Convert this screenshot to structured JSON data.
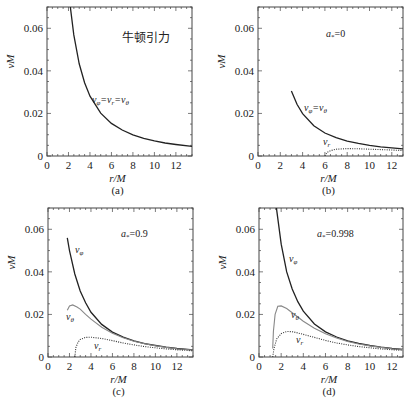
{
  "figure": {
    "ylabel": "νM",
    "xlabel": "r/M"
  },
  "chart_data": [
    {
      "type": "line",
      "panel": "(a)",
      "annotation": "牛顿引力",
      "xlabel": "r/M",
      "ylabel": "νM",
      "xlim": [
        0,
        13.5
      ],
      "ylim": [
        0,
        0.07
      ],
      "xticks": [
        0,
        2,
        4,
        6,
        8,
        10,
        12
      ],
      "yticks": [
        "0",
        "0.02",
        "0.04",
        "0.06"
      ],
      "grid": false,
      "series": [
        {
          "name": "ν_φ=ν_r=ν_θ",
          "style": "solid",
          "x": [
            2.0,
            2.2,
            2.5,
            3,
            3.5,
            4,
            5,
            6,
            7,
            8,
            9,
            10,
            11,
            12,
            13.5
          ],
          "y": [
            0.0796,
            0.069,
            0.0569,
            0.0433,
            0.0344,
            0.0281,
            0.0201,
            0.0153,
            0.0122,
            0.0099,
            0.0083,
            0.0071,
            0.0061,
            0.0054,
            0.0045
          ]
        }
      ]
    },
    {
      "type": "line",
      "panel": "(b)",
      "annotation": "a*=0",
      "xlabel": "r/M",
      "ylabel": "νM",
      "xlim": [
        0,
        13
      ],
      "ylim": [
        0,
        0.07
      ],
      "xticks": [
        0,
        2,
        4,
        6,
        8,
        10,
        12
      ],
      "yticks": [
        "0",
        "0.02",
        "0.04",
        "0.06"
      ],
      "grid": false,
      "series": [
        {
          "name": "ν_φ=ν_θ",
          "style": "solid",
          "x": [
            3,
            3.5,
            4,
            5,
            6,
            7,
            8,
            9,
            10,
            11,
            12,
            13
          ],
          "y": [
            0.0306,
            0.0243,
            0.0199,
            0.0142,
            0.0108,
            0.0086,
            0.007,
            0.0059,
            0.005,
            0.0043,
            0.0038,
            0.0034
          ]
        },
        {
          "name": "ν_r",
          "style": "dotted",
          "x": [
            6,
            6.2,
            6.5,
            7,
            8,
            9,
            10,
            11,
            12,
            13
          ],
          "y": [
            0.0,
            0.0017,
            0.0025,
            0.0032,
            0.0035,
            0.0034,
            0.0032,
            0.003,
            0.0028,
            0.0026
          ]
        }
      ]
    },
    {
      "type": "line",
      "panel": "(c)",
      "annotation": "a*=0.9",
      "xlabel": "r/M",
      "ylabel": "νM",
      "xlim": [
        0,
        13.5
      ],
      "ylim": [
        0,
        0.07
      ],
      "xticks": [
        0,
        2,
        4,
        6,
        8,
        10,
        12
      ],
      "yticks": [
        "0",
        "0.02",
        "0.04",
        "0.06"
      ],
      "grid": false,
      "series": [
        {
          "name": "ν_φ",
          "style": "solid",
          "x": [
            1.8,
            2,
            2.5,
            3,
            3.5,
            4,
            5,
            6,
            7,
            8,
            9,
            10,
            11,
            12,
            13.5
          ],
          "y": [
            0.056,
            0.05,
            0.039,
            0.031,
            0.0255,
            0.021,
            0.0153,
            0.0117,
            0.0093,
            0.0076,
            0.0063,
            0.0054,
            0.0046,
            0.004,
            0.0034
          ]
        },
        {
          "name": "ν_θ",
          "style": "solid-gray",
          "x": [
            1.8,
            2,
            2.3,
            2.7,
            3,
            3.5,
            4,
            5,
            6,
            7,
            8,
            9,
            10,
            11,
            12,
            13.5
          ],
          "y": [
            0.022,
            0.024,
            0.0245,
            0.0235,
            0.0225,
            0.02,
            0.0178,
            0.014,
            0.0112,
            0.009,
            0.0074,
            0.0062,
            0.0053,
            0.0045,
            0.0039,
            0.0033
          ]
        },
        {
          "name": "ν_r",
          "style": "dotted",
          "x": [
            2.5,
            2.6,
            2.8,
            3,
            3.5,
            4,
            5,
            6,
            7,
            8,
            9,
            10,
            11,
            12,
            13.5
          ],
          "y": [
            0.0,
            0.0045,
            0.007,
            0.0082,
            0.0092,
            0.0093,
            0.0087,
            0.0077,
            0.0066,
            0.0057,
            0.0049,
            0.0043,
            0.0038,
            0.0034,
            0.0029
          ]
        }
      ]
    },
    {
      "type": "line",
      "panel": "(d)",
      "annotation": "a*=0.998",
      "xlabel": "r/M",
      "ylabel": "νM",
      "xlim": [
        0,
        13
      ],
      "ylim": [
        0,
        0.07
      ],
      "xticks": [
        0,
        2,
        4,
        6,
        8,
        10,
        12
      ],
      "yticks": [
        "0",
        "0.02",
        "0.04",
        "0.06"
      ],
      "grid": false,
      "series": [
        {
          "name": "ν_φ",
          "style": "solid",
          "x": [
            1.24,
            1.4,
            1.6,
            2,
            2.5,
            3,
            3.5,
            4,
            5,
            6,
            7,
            8,
            9,
            10,
            11,
            12,
            13
          ],
          "y": [
            0.092,
            0.08,
            0.069,
            0.053,
            0.04,
            0.032,
            0.026,
            0.0215,
            0.0155,
            0.0118,
            0.0094,
            0.0076,
            0.0064,
            0.0054,
            0.0046,
            0.004,
            0.0036
          ]
        },
        {
          "name": "ν_θ",
          "style": "solid-gray",
          "x": [
            1.24,
            1.3,
            1.45,
            1.7,
            2,
            2.5,
            3,
            3.5,
            4,
            5,
            6,
            7,
            8,
            9,
            10,
            11,
            12,
            13
          ],
          "y": [
            0.004,
            0.012,
            0.02,
            0.0238,
            0.024,
            0.0228,
            0.0208,
            0.0188,
            0.0168,
            0.0135,
            0.0109,
            0.0089,
            0.0073,
            0.0061,
            0.0052,
            0.0045,
            0.0039,
            0.0035
          ]
        },
        {
          "name": "ν_r",
          "style": "dotted",
          "x": [
            1.24,
            1.35,
            1.6,
            2,
            2.5,
            3,
            3.5,
            4,
            5,
            6,
            7,
            8,
            9,
            10,
            11,
            12,
            13
          ],
          "y": [
            0.0,
            0.004,
            0.0085,
            0.011,
            0.012,
            0.0119,
            0.0113,
            0.0106,
            0.0092,
            0.0078,
            0.0066,
            0.0057,
            0.0049,
            0.0043,
            0.0038,
            0.0034,
            0.0031
          ]
        }
      ]
    }
  ],
  "panels": [
    {
      "caption": "(a)",
      "box": {
        "x": 47,
        "y": 7,
        "w": 145,
        "h": 149
      },
      "x0px": 47,
      "xscale": 10.74,
      "annotation_pos": {
        "x": 122,
        "y": 42
      },
      "labels": [
        {
          "text": "ν_φ=ν_r=ν_θ",
          "x": 92,
          "y": 103,
          "series": 0
        }
      ],
      "cn": true
    },
    {
      "caption": "(b)",
      "box": {
        "x": 258,
        "y": 7,
        "w": 145,
        "h": 149
      },
      "x0px": 258,
      "xscale": 11.15,
      "annotation_pos": {
        "x": 326,
        "y": 37
      },
      "labels": [
        {
          "text": "ν_φ=ν_θ",
          "x": 304,
          "y": 111,
          "series": 0
        },
        {
          "text": "ν_r",
          "x": 323,
          "y": 145,
          "series": 1
        }
      ]
    },
    {
      "caption": "(c)",
      "box": {
        "x": 48,
        "y": 208,
        "w": 145,
        "h": 149
      },
      "x0px": 48,
      "xscale": 10.74,
      "annotation_pos": {
        "x": 121,
        "y": 237
      },
      "labels": [
        {
          "text": "ν_φ",
          "x": 75,
          "y": 253,
          "series": 0
        },
        {
          "text": "ν_θ",
          "x": 66,
          "y": 320,
          "series": 1
        },
        {
          "text": "ν_r",
          "x": 94,
          "y": 349,
          "series": 2
        }
      ]
    },
    {
      "caption": "(d)",
      "box": {
        "x": 259,
        "y": 208,
        "w": 144,
        "h": 149
      },
      "x0px": 259,
      "xscale": 11.08,
      "annotation_pos": {
        "x": 317,
        "y": 237
      },
      "labels": [
        {
          "text": "ν_φ",
          "x": 289,
          "y": 262,
          "series": 0
        },
        {
          "text": "ν_θ",
          "x": 291,
          "y": 318,
          "series": 1
        },
        {
          "text": "ν_r",
          "x": 296,
          "y": 343,
          "series": 2
        }
      ]
    }
  ],
  "colors": {
    "frame": "#444444",
    "solid": "#222222",
    "gray": "#888888",
    "dotted": "#333333",
    "text": "#222222"
  }
}
